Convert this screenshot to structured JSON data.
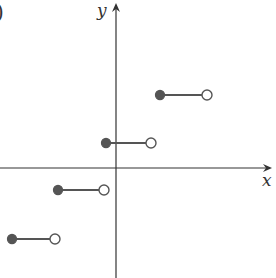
{
  "panel_label": ")",
  "chart_data": {
    "type": "line",
    "subtype": "step-function",
    "title": "",
    "xlabel": "x",
    "ylabel": "y",
    "grid": false,
    "legend": null,
    "tick_labels": [],
    "axes": {
      "origin_px": [
        116,
        168
      ],
      "unit_px": 48,
      "x_axis": {
        "from_px": 0,
        "to_px": 272,
        "arrow": true
      },
      "y_axis": {
        "from_px": 278,
        "to_px": 3,
        "arrow": true
      }
    },
    "segments": [
      {
        "x_start": -2.2,
        "x_end": -1.3,
        "y": -1.5,
        "start_closed": true,
        "end_closed": false,
        "px": [
          [
            12,
            239
          ],
          [
            55,
            239
          ]
        ]
      },
      {
        "x_start": -1.2,
        "x_end": -0.25,
        "y": -0.5,
        "start_closed": true,
        "end_closed": false,
        "px": [
          [
            58,
            190
          ],
          [
            104,
            190
          ]
        ]
      },
      {
        "x_start": -0.2,
        "x_end": 0.75,
        "y": 0.5,
        "start_closed": true,
        "end_closed": false,
        "px": [
          [
            106,
            143
          ],
          [
            151,
            143
          ]
        ]
      },
      {
        "x_start": 0.9,
        "x_end": 1.9,
        "y": 1.5,
        "start_closed": true,
        "end_closed": false,
        "px": [
          [
            160,
            95
          ],
          [
            207,
            95
          ]
        ]
      }
    ],
    "colors": {
      "axis": "#333333",
      "segment": "#555555",
      "closed_dot": "#555555",
      "open_dot_fill": "#ffffff"
    }
  }
}
